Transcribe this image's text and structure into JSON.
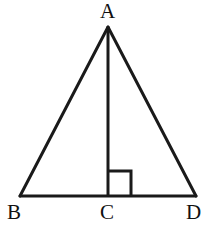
{
  "figure": {
    "kind": "geometry-diagram",
    "background_color": "#ffffff",
    "stroke_color": "#1a1a1a",
    "label_color": "#111111",
    "stroke_width": 3,
    "marker_stroke_width": 3,
    "canvas": {
      "width": 214,
      "height": 234
    },
    "points": {
      "A": {
        "x": 108,
        "y": 27
      },
      "B": {
        "x": 20,
        "y": 196
      },
      "C": {
        "x": 108,
        "y": 196
      },
      "D": {
        "x": 196,
        "y": 196
      }
    },
    "segments": [
      {
        "name": "AB",
        "from": "A",
        "to": "B"
      },
      {
        "name": "AD",
        "from": "A",
        "to": "D"
      },
      {
        "name": "BD",
        "from": "B",
        "to": "D"
      },
      {
        "name": "AC",
        "from": "A",
        "to": "C"
      }
    ],
    "right_angle_marker": {
      "at_point": "C",
      "side": "right",
      "size": 23,
      "x": 108,
      "y": 171,
      "width": 23,
      "height": 25
    },
    "labels": [
      {
        "id": "A",
        "text": "A",
        "x": 100,
        "y": 1
      },
      {
        "id": "B",
        "text": "B",
        "x": 7,
        "y": 202
      },
      {
        "id": "C",
        "text": "C",
        "x": 100,
        "y": 202
      },
      {
        "id": "D",
        "text": "D",
        "x": 186,
        "y": 202
      }
    ]
  }
}
